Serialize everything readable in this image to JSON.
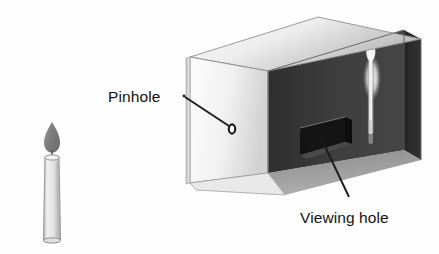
{
  "figure": {
    "background_color": "#fefefe",
    "width": 439,
    "height": 254
  },
  "labels": {
    "pinhole": "Pinhole",
    "viewing_hole": "Viewing hole"
  },
  "colors": {
    "text": "#121212",
    "leader_line": "#1b1b1b",
    "box_top_light": "#f4f4f4",
    "box_top_dark": "#b8b8b8",
    "box_front_light": "#fbfbfb",
    "box_front_dark": "#cfcfcf",
    "box_interior_back": "#3a3a3a",
    "box_interior_side": "#2c2c2c",
    "box_floor": "#9a9a9a",
    "viewing_hole_fill": "#141414",
    "pinhole_stroke": "#1a1a1a",
    "candle_body": "#dcdcdc",
    "candle_outline": "#8c8c8c",
    "flame_fill": "#8a8a8a",
    "image_candle_glow": "#f2f2f2"
  },
  "objects": {
    "candle": {
      "name": "candle",
      "description": "Lit candle outside the box at left"
    },
    "box": {
      "name": "pinhole-camera-box",
      "description": "Cutaway box showing dark interior"
    },
    "inverted_image": {
      "name": "inverted-candle-image",
      "description": "Inverted bright image of the candle projected on the interior back wall"
    },
    "pinhole": {
      "name": "pinhole-aperture",
      "description": "Small hole in the front-left face of the box"
    },
    "viewing_hole": {
      "name": "viewing-hole-opening",
      "description": "Rectangular cut opening in the back wall of the box"
    }
  }
}
